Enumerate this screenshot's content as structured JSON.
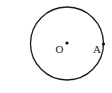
{
  "diagram": {
    "type": "geometry",
    "circle": {
      "cx": 67,
      "cy": 43.5,
      "r": 36.5,
      "stroke": "#1a1a1a"
    },
    "points": [
      {
        "id": "O",
        "label": "O",
        "x": 67,
        "y": 43,
        "label_x": 55.5,
        "label_y": 53
      },
      {
        "id": "A",
        "label": "A",
        "x": 103.5,
        "y": 44,
        "label_x": 93,
        "label_y": 53
      }
    ]
  }
}
